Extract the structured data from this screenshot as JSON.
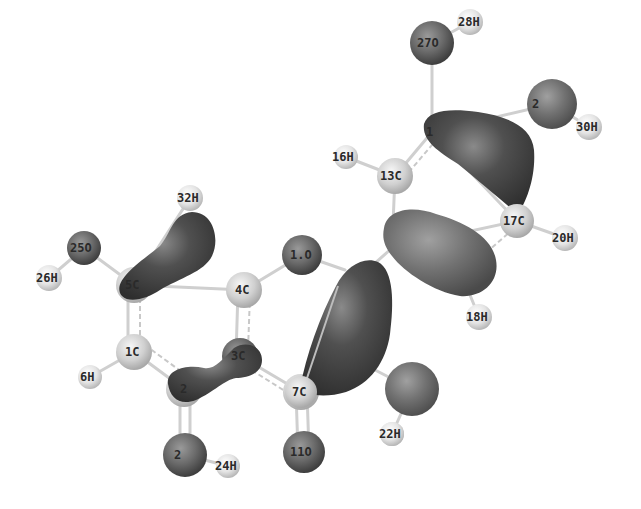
{
  "figure": {
    "type": "molecular-orbital-isosurface",
    "background": "#ffffff",
    "colors": {
      "hydrogen": "#e8e8e8",
      "carbon": "#d2d2d2",
      "oxygen": "#6a6a6a",
      "lobe_dark": "#4a4a4a",
      "lobe_medium": "#6e6e6e",
      "bond": "#cfcfcf",
      "label": "#2a2a2a"
    }
  },
  "atoms": [
    {
      "id": "28H",
      "label": "28H",
      "x": 470,
      "y": 22,
      "r": 13,
      "type": "H"
    },
    {
      "id": "27O",
      "label": "27O",
      "x": 432,
      "y": 43,
      "r": 22,
      "type": "O"
    },
    {
      "id": "29O",
      "label": "2",
      "x": 552,
      "y": 104,
      "r": 25,
      "type": "O"
    },
    {
      "id": "30H",
      "label": "30H",
      "x": 589,
      "y": 127,
      "r": 13,
      "type": "H"
    },
    {
      "id": "15C",
      "label": "1",
      "x": 432,
      "y": 132,
      "r": 14,
      "type": "C"
    },
    {
      "id": "16H",
      "label": "16H",
      "x": 346,
      "y": 157,
      "r": 12,
      "type": "H"
    },
    {
      "id": "13C",
      "label": "13C",
      "x": 395,
      "y": 176,
      "r": 18,
      "type": "C"
    },
    {
      "id": "17C",
      "label": "17C",
      "x": 517,
      "y": 221,
      "r": 17,
      "type": "C"
    },
    {
      "id": "20H",
      "label": "20H",
      "x": 565,
      "y": 238,
      "r": 13,
      "type": "H"
    },
    {
      "id": "14C",
      "label": "",
      "x": 392,
      "y": 248,
      "r": 14,
      "type": "C"
    },
    {
      "id": "18H",
      "label": "18H",
      "x": 479,
      "y": 317,
      "r": 13,
      "type": "H"
    },
    {
      "id": "32H",
      "label": "32H",
      "x": 190,
      "y": 198,
      "r": 13,
      "type": "H"
    },
    {
      "id": "25O",
      "label": "25O",
      "x": 84,
      "y": 248,
      "r": 17,
      "type": "O"
    },
    {
      "id": "26H",
      "label": "26H",
      "x": 49,
      "y": 278,
      "r": 13,
      "type": "H"
    },
    {
      "id": "5C",
      "label": "5C",
      "x": 134,
      "y": 285,
      "r": 18,
      "type": "C"
    },
    {
      "id": "4C",
      "label": "4C",
      "x": 244,
      "y": 290,
      "r": 18,
      "type": "C"
    },
    {
      "id": "10O",
      "label": "1.O",
      "x": 302,
      "y": 255,
      "r": 20,
      "type": "O"
    },
    {
      "id": "1C",
      "label": "1C",
      "x": 134,
      "y": 352,
      "r": 18,
      "type": "C"
    },
    {
      "id": "6H",
      "label": "6H",
      "x": 90,
      "y": 377,
      "r": 12,
      "type": "H"
    },
    {
      "id": "3C",
      "label": "3C",
      "x": 240,
      "y": 356,
      "r": 18,
      "type": "C"
    },
    {
      "id": "2C",
      "label": "2",
      "x": 184,
      "y": 389,
      "r": 18,
      "type": "C"
    },
    {
      "id": "7C",
      "label": "7C",
      "x": 301,
      "y": 392,
      "r": 18,
      "type": "C"
    },
    {
      "id": "23O",
      "label": "2",
      "x": 185,
      "y": 455,
      "r": 22,
      "type": "O"
    },
    {
      "id": "24H",
      "label": "24H",
      "x": 228,
      "y": 466,
      "r": 12,
      "type": "H"
    },
    {
      "id": "11O",
      "label": "11O",
      "x": 304,
      "y": 452,
      "r": 21,
      "type": "O"
    },
    {
      "id": "22H",
      "label": "22H",
      "x": 392,
      "y": 434,
      "r": 12,
      "type": "H"
    },
    {
      "id": "21O",
      "label": "",
      "x": 412,
      "y": 389,
      "r": 27,
      "type": "O"
    }
  ],
  "bonds": [
    [
      "28H",
      "27O"
    ],
    [
      "27O",
      "15C"
    ],
    [
      "15C",
      "29O"
    ],
    [
      "29O",
      "30H"
    ],
    [
      "15C",
      "13C"
    ],
    [
      "16H",
      "13C"
    ],
    [
      "13C",
      "14C"
    ],
    [
      "14C",
      "17C"
    ],
    [
      "15C",
      "17C"
    ],
    [
      "17C",
      "20H"
    ],
    [
      "14C",
      "18H"
    ],
    [
      "14C",
      "8C"
    ],
    [
      "32H",
      "5C"
    ],
    [
      "25O",
      "5C"
    ],
    [
      "26H",
      "25O"
    ],
    [
      "5C",
      "4C"
    ],
    [
      "4C",
      "10O"
    ],
    [
      "10O",
      "8C"
    ],
    [
      "5C",
      "1C"
    ],
    [
      "1C",
      "6H"
    ],
    [
      "1C",
      "2C"
    ],
    [
      "2C",
      "3C"
    ],
    [
      "3C",
      "4C"
    ],
    [
      "3C",
      "7C"
    ],
    [
      "7C",
      "8C"
    ],
    [
      "7C",
      "11O"
    ],
    [
      "2C",
      "23O"
    ],
    [
      "23O",
      "24H"
    ],
    [
      "8C",
      "21O"
    ],
    [
      "21O",
      "22H"
    ]
  ],
  "lobes": [
    {
      "name": "lobe-5C-32H",
      "shade": "dark"
    },
    {
      "name": "lobe-2C-3C",
      "shade": "dark"
    },
    {
      "name": "lobe-8C-7C",
      "shade": "dark"
    },
    {
      "name": "lobe-14C-17C",
      "shade": "medium"
    },
    {
      "name": "lobe-15C-17C",
      "shade": "dark"
    }
  ]
}
